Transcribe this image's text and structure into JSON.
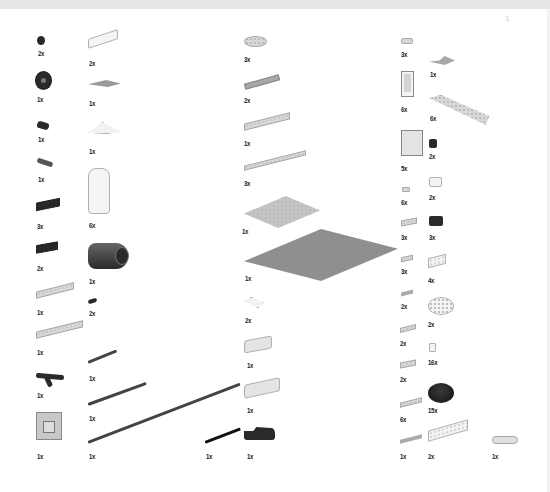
{
  "page": {
    "type": "LEGO instruction parts inventory",
    "page_mark": "1"
  },
  "parts": [
    {
      "id": "p1",
      "shape": "gear-small",
      "color": "#2a2a2a",
      "qty": "2x"
    },
    {
      "id": "p2",
      "shape": "slope-brick",
      "color": "#f0f0f0",
      "qty": "2x"
    },
    {
      "id": "p3",
      "shape": "round-plate",
      "color": "#cfcfcf",
      "qty": "3x"
    },
    {
      "id": "p4",
      "shape": "tile-1x1",
      "color": "#d0d0d0",
      "qty": "3x"
    },
    {
      "id": "p5",
      "shape": "gear-24t",
      "color": "#1e1e1e",
      "qty": "1x"
    },
    {
      "id": "p6",
      "shape": "wedge-plate",
      "color": "#cfcfcf",
      "qty": "1x"
    },
    {
      "id": "p7",
      "shape": "plate-1x6",
      "color": "#cfcfcf",
      "qty": "2x"
    },
    {
      "id": "p8",
      "shape": "wing-plate",
      "color": "#bdbdbd",
      "qty": "1x"
    },
    {
      "id": "p9",
      "shape": "door-frame",
      "color": "#e8e8e8",
      "qty": "6x"
    },
    {
      "id": "p10",
      "shape": "wedge-plate-long",
      "color": "#d6d6d6",
      "qty": "6x"
    },
    {
      "id": "p11",
      "shape": "technic-bush",
      "color": "#2a2a2a",
      "qty": "1x"
    },
    {
      "id": "p12",
      "shape": "slope-curved",
      "color": "#f0f0f0",
      "qty": "1x"
    },
    {
      "id": "p13",
      "shape": "plate-2x6",
      "color": "#cfcfcf",
      "qty": "1x"
    },
    {
      "id": "p14",
      "shape": "technic-connector",
      "color": "#333333",
      "qty": "1x"
    },
    {
      "id": "p15",
      "shape": "plate-1x12",
      "color": "#cfcfcf",
      "qty": "3x"
    },
    {
      "id": "p16",
      "shape": "panel-1x4x3",
      "color": "#e8e8e8",
      "qty": "5x"
    },
    {
      "id": "p17",
      "shape": "brick-1x1-dark",
      "color": "#1e1e1e",
      "qty": "2x"
    },
    {
      "id": "p18",
      "shape": "technic-brick-1x4",
      "color": "#2a2a2a",
      "qty": "3x"
    },
    {
      "id": "p19",
      "shape": "cylinder-half",
      "color": "#f4f4f4",
      "qty": "6x"
    },
    {
      "id": "p20",
      "shape": "plate-8x8",
      "color": "#c8c8c8",
      "qty": "1x"
    },
    {
      "id": "p21",
      "shape": "tile-1x1-small",
      "color": "#cfcfcf",
      "qty": "6x"
    },
    {
      "id": "p22",
      "shape": "brick-1x2-white",
      "color": "#f4f4f4",
      "qty": "2x"
    },
    {
      "id": "p23",
      "shape": "plate-2x2",
      "color": "#cfcfcf",
      "qty": "3x"
    },
    {
      "id": "p24",
      "shape": "brick-1x2-black",
      "color": "#1a1a1a",
      "qty": "3x"
    },
    {
      "id": "p25",
      "shape": "technic-brick-1x4b",
      "color": "#2a2a2a",
      "qty": "2x"
    },
    {
      "id": "p26",
      "shape": "motor",
      "color": "#3a3a3a",
      "qty": "1x"
    },
    {
      "id": "p27",
      "shape": "baseplate-16x16",
      "color": "#8f8f8f",
      "qty": "1x"
    },
    {
      "id": "p28",
      "shape": "plate-1x2",
      "color": "#cfcfcf",
      "qty": "3x"
    },
    {
      "id": "p29",
      "shape": "brick-1x4",
      "color": "#f0f0f0",
      "qty": "4x"
    },
    {
      "id": "p30",
      "shape": "plate-2x4",
      "color": "#cfcfcf",
      "qty": "1x"
    },
    {
      "id": "p31",
      "shape": "technic-pin",
      "color": "#222222",
      "qty": "2x"
    },
    {
      "id": "p32",
      "shape": "slope-2x2",
      "color": "#f4f4f4",
      "qty": "2x"
    },
    {
      "id": "p33",
      "shape": "tile-1x2",
      "color": "#bdbdbd",
      "qty": "2x"
    },
    {
      "id": "p34",
      "shape": "round-brick-4x4",
      "color": "#f0f0f0",
      "qty": "2x"
    },
    {
      "id": "p35",
      "shape": "plate-2x8",
      "color": "#cfcfcf",
      "qty": "1x"
    },
    {
      "id": "p36",
      "shape": "plate-1x3",
      "color": "#cfcfcf",
      "qty": "2x"
    },
    {
      "id": "p37",
      "shape": "brick-1x1-clear",
      "color": "#f4f4f4",
      "qty": "16x"
    },
    {
      "id": "p38",
      "shape": "axle-short",
      "color": "#555555",
      "qty": "1x"
    },
    {
      "id": "p39",
      "shape": "inverted-slope",
      "color": "#e0e0e0",
      "qty": "1x"
    },
    {
      "id": "p40",
      "shape": "plate-2x2b",
      "color": "#cfcfcf",
      "qty": "2x"
    },
    {
      "id": "p41",
      "shape": "technic-triangle",
      "color": "#2a2a2a",
      "qty": "1x"
    },
    {
      "id": "p42",
      "shape": "round-brick-dark",
      "color": "#1a1a1a",
      "qty": "15x"
    },
    {
      "id": "p43",
      "shape": "axle-medium",
      "color": "#555555",
      "qty": "1x"
    },
    {
      "id": "p44",
      "shape": "inverted-slope-2",
      "color": "#e0e0e0",
      "qty": "1x"
    },
    {
      "id": "p45",
      "shape": "plate-1x4",
      "color": "#cfcfcf",
      "qty": "6x"
    },
    {
      "id": "p46",
      "shape": "technic-frame",
      "color": "#bdbdbd",
      "qty": "1x"
    },
    {
      "id": "p47",
      "shape": "axle-long",
      "color": "#555555",
      "qty": "1x"
    },
    {
      "id": "p48",
      "shape": "axle-black",
      "color": "#1a1a1a",
      "qty": "1x"
    },
    {
      "id": "p49",
      "shape": "technic-beam-dark",
      "color": "#1e1e1e",
      "qty": "1x"
    },
    {
      "id": "p50",
      "shape": "tile-1x4",
      "color": "#bdbdbd",
      "qty": "1x"
    },
    {
      "id": "p51",
      "shape": "brick-1x8",
      "color": "#f0f0f0",
      "qty": "2x"
    },
    {
      "id": "p52",
      "shape": "clip-hinge",
      "color": "#d8d8d8",
      "qty": "1x"
    }
  ]
}
